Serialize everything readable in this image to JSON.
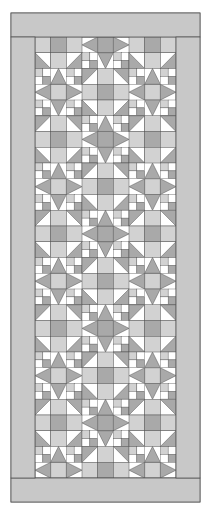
{
  "diagram": {
    "type": "quilt-layout",
    "title": "",
    "outer_border": {
      "x": 11,
      "y": 13,
      "width": 189,
      "height": 489,
      "color": "#c8c8c8"
    },
    "inner_field": {
      "x": 35,
      "y": 37,
      "width": 141,
      "height": 441,
      "columns": 9,
      "rows": 28
    },
    "colors": {
      "light": "#ffffff",
      "medium": "#d2d2d2",
      "dark": "#a9a9a9",
      "line": "#555555",
      "border": "#c8c8c8"
    },
    "blocks": {
      "star_block_count": 13,
      "description": "Alternating sawtooth star blocks with four-patch corners and square centers"
    }
  }
}
